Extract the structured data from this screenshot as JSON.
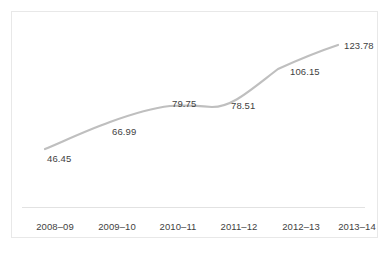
{
  "chart_data": {
    "type": "line",
    "title": "",
    "subtitle": "",
    "xlabel": "",
    "ylabel": "",
    "categories": [
      "2008–09",
      "2009–10",
      "2010–11",
      "2011–12",
      "2012–13",
      "2013–14"
    ],
    "values": [
      46.45,
      66.99,
      79.75,
      78.51,
      106.15,
      123.78
    ],
    "point_labels": [
      "46.45",
      "66.99",
      "79.75",
      "78.51",
      "106.15",
      "123.78"
    ],
    "series": [
      {
        "name": "",
        "values": [
          46.45,
          66.99,
          79.75,
          78.51,
          106.15,
          123.78
        ]
      }
    ],
    "ylim": [
      0,
      135
    ],
    "grid": false,
    "legend": "none",
    "smoothed": true,
    "line_color": "#bfbfbf",
    "text_color": "#3f3f3f",
    "axis_color": "#e2e2e2",
    "border_color": "#e8e8e8",
    "background": "#ffffff"
  },
  "geometry": {
    "points": [
      {
        "x": 45,
        "y": 149,
        "label_x": 47,
        "label_y": 154
      },
      {
        "x": 110,
        "y": 122,
        "label_x": 112,
        "label_y": 127
      },
      {
        "x": 170,
        "y": 106,
        "label_x": 172,
        "label_y": 99
      },
      {
        "x": 212,
        "y": 107,
        "label_x": 231,
        "label_y": 101
      },
      {
        "x": 278,
        "y": 69,
        "label_x": 290,
        "label_y": 67
      },
      {
        "x": 338,
        "y": 45,
        "label_x": 344,
        "label_y": 41
      }
    ],
    "ticks": [
      {
        "x": 55
      },
      {
        "x": 117
      },
      {
        "x": 178
      },
      {
        "x": 239
      },
      {
        "x": 301
      },
      {
        "x": 357
      }
    ],
    "path": "M 45 149 C 62 142, 85 131, 110 122 C 132 114, 152 108, 170 106 C 185 105, 200 106, 212 107 C 232 107, 248 92, 278 69 C 300 59, 320 51, 338 45"
  }
}
